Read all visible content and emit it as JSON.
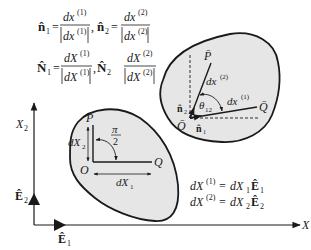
{
  "equations": {
    "n1_lhs": "n̂",
    "n1_sub": "1",
    "n1_num": "dx",
    "n1_num_sup": "(1)",
    "n1_den": "dx",
    "n1_den_sup": "(1)",
    "n2_lhs": "n̂",
    "n2_sub": "2",
    "n2_num": "dx",
    "n2_num_sup": "(2)",
    "n2_den": "dx",
    "n2_den_sup": "(2)",
    "N1_lhs": "N̂",
    "N1_sub": "1",
    "N1_num": "dX",
    "N1_num_sup": "(1)",
    "N1_den": "dX",
    "N1_den_sup": "(1)",
    "N2_lhs": "N̂",
    "N2_sub": "2",
    "N2_num": "dX",
    "N2_num_sup": "(2)",
    "N2_den": "dX",
    "N2_den_sup": "(2)",
    "equals": "=",
    "comma": ","
  },
  "axes": {
    "x_label": "X",
    "x_sub": "1",
    "y_label": "X",
    "y_sub": "2",
    "e1_label": "Ê",
    "e1_sub": "1",
    "e2_label": "Ê",
    "e2_sub": "2"
  },
  "reference_body": {
    "P": "P",
    "O": "O",
    "Q": "Q",
    "dX1": "dX",
    "dX1_sub": "1",
    "dX2": "dX",
    "dX2_sub": "2",
    "angle_num": "π",
    "angle_den": "2"
  },
  "deformed_body": {
    "P": "P̄",
    "O": "Ō",
    "Q": "Q̄",
    "dx2": "dx",
    "dx2_sup": "(2)",
    "dx1": "dx",
    "dx1_sup": "(1)",
    "theta": "θ",
    "theta_sub": "12",
    "n1": "n̂",
    "n1_sub": "1",
    "n2": "n̂",
    "n2_sub": "2"
  },
  "relations": {
    "line1_lhs": "dX",
    "line1_sup": "(1)",
    "line1_rhs": "dX",
    "line1_rhs_sub": "1",
    "line1_E": "Ê",
    "line1_E_sub": "1",
    "line2_lhs": "dX",
    "line2_sup": "(2)",
    "line2_rhs": "dX",
    "line2_rhs_sub": "2",
    "line2_E": "Ê",
    "line2_E_sub": "2",
    "equals": "="
  },
  "colors": {
    "body_fill": "#e6e6e6",
    "stroke": "#1a1a1a",
    "background": "#ffffff"
  }
}
